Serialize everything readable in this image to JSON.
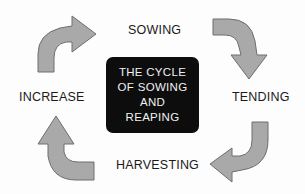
{
  "diagram": {
    "center_title_lines": [
      "THE CYCLE",
      "OF SOWING",
      "AND",
      "REAPING"
    ],
    "stages": [
      {
        "label": "SOWING"
      },
      {
        "label": "TENDING"
      },
      {
        "label": "HARVESTING"
      },
      {
        "label": "INCREASE"
      }
    ],
    "colors": {
      "arrow_fill": "#a9a9a9",
      "arrow_stroke": "#6e6e6e",
      "center_box": "#0d0d0d",
      "center_text": "#f0f0f0",
      "label_text": "#1a1a1a"
    },
    "flow": "clockwise"
  }
}
